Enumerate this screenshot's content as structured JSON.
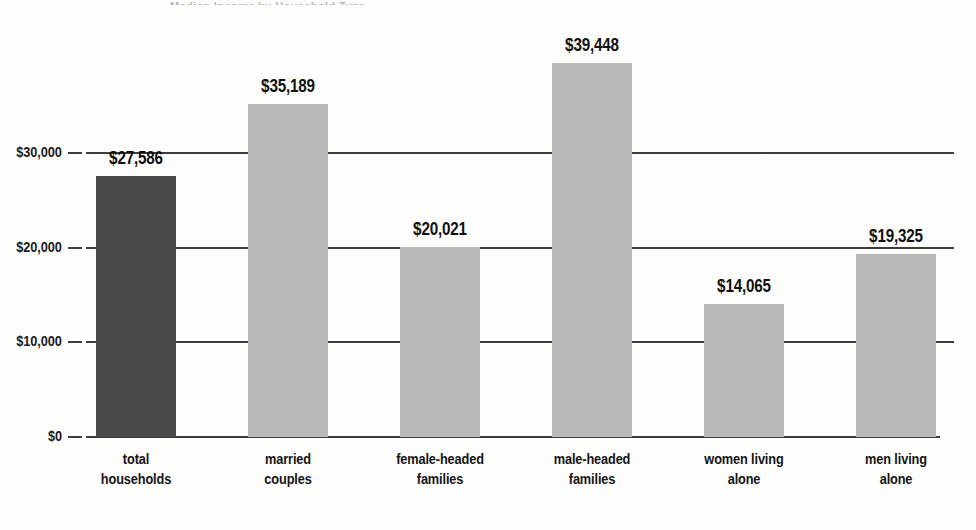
{
  "figure": {
    "top_fragment_text": "Median Income by Household Type"
  },
  "colors": {
    "bar_highlight": "#4a4a4a",
    "bar_default": "#b9b9b9",
    "axis": "#3d3d3d",
    "text": "#111111",
    "background": "#fdfdfc"
  },
  "chart_data": {
    "type": "bar",
    "title": "",
    "xlabel": "",
    "ylabel": "",
    "ylim": [
      0,
      42000
    ],
    "grid": true,
    "legend": "none",
    "categories": [
      "total households",
      "married couples",
      "female-headed families",
      "male-headed families",
      "women living alone",
      "men living alone"
    ],
    "category_lines": [
      [
        "total",
        "households"
      ],
      [
        "married",
        "couples"
      ],
      [
        "female-headed",
        "families"
      ],
      [
        "male-headed",
        "families"
      ],
      [
        "women living",
        "alone"
      ],
      [
        "men living",
        "alone"
      ]
    ],
    "values": [
      27586,
      35189,
      20021,
      39448,
      14065,
      19325
    ],
    "value_labels": [
      "$27,586",
      "$35,189",
      "$20,021",
      "$39,448",
      "$14,065",
      "$19,325"
    ],
    "bar_colors": [
      "#4a4a4a",
      "#b9b9b9",
      "#b9b9b9",
      "#b9b9b9",
      "#b9b9b9",
      "#b9b9b9"
    ],
    "yticks": [
      0,
      10000,
      20000,
      30000
    ],
    "ytick_labels": [
      "$0",
      "$10,000",
      "$20,000",
      "$30,000"
    ]
  }
}
